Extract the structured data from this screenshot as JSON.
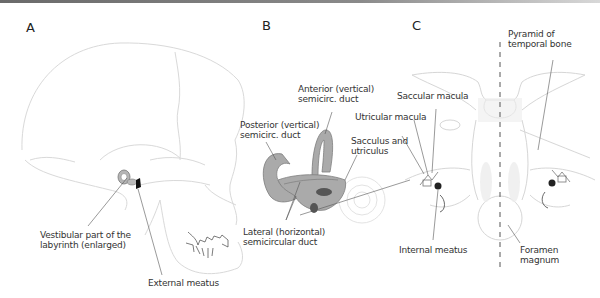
{
  "panels": {
    "A": {
      "letter": "A",
      "labels": {
        "vestibular_line1": "Vestibular part of the",
        "vestibular_line2": "labyrinth (enlarged)",
        "external_meatus": "External meatus"
      }
    },
    "B": {
      "letter": "B",
      "labels": {
        "anterior_line1": "Anterior (vertical)",
        "anterior_line2": "semicirc. duct",
        "posterior_line1": "Posterior (vertical)",
        "posterior_line2": "semicirc. duct",
        "sacculus_line1": "Sacculus and",
        "sacculus_line2": "utriculus",
        "lateral_line1": "Lateral (horizontal)",
        "lateral_line2": "semicircular duct",
        "utricular_macula": "Utricular macula",
        "saccular_macula": "Saccular macula"
      }
    },
    "C": {
      "letter": "C",
      "labels": {
        "pyramid_line1": "Pyramid of",
        "pyramid_line2": "temporal bone",
        "internal_meatus": "Internal meatus",
        "foramen_line1": "Foramen",
        "foramen_line2": "magnum"
      }
    }
  },
  "colors": {
    "line": "#555555",
    "outline": "#d6d6d6",
    "duct_fill": "#a9a9a9",
    "duct_stroke": "#7a7a7a",
    "macula": "#555555"
  }
}
